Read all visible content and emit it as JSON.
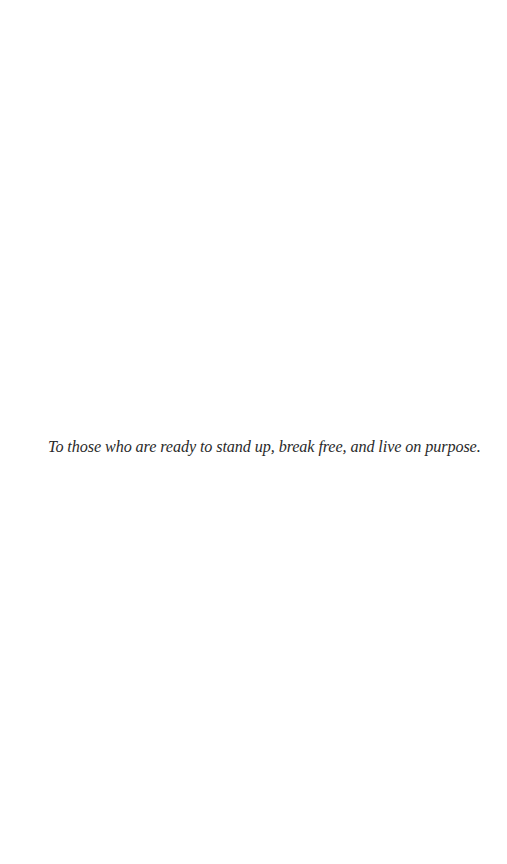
{
  "page": {
    "type": "dedication",
    "dedication_text": "To those who are ready to stand up, break free, and live on purpose."
  }
}
